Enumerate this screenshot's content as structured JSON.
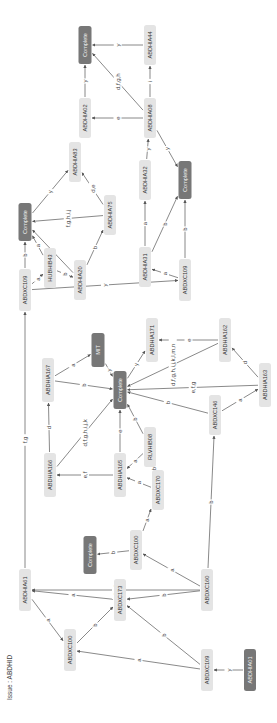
{
  "issue_label": "Issue : ABDHID",
  "colors": {
    "node_fill": "#e4e4e4",
    "complete_fill": "#777777",
    "edge": "#6b6b6b"
  },
  "nodes": [
    {
      "id": "n1",
      "label": "ABDHIA61",
      "x": 25,
      "y": 590,
      "w": 12,
      "h": 42,
      "kind": "normal"
    },
    {
      "id": "n2",
      "label": "ABDXC100",
      "x": 70,
      "y": 650,
      "w": 12,
      "h": 42,
      "kind": "normal"
    },
    {
      "id": "n3",
      "label": "ABDXC173",
      "x": 120,
      "y": 600,
      "w": 12,
      "h": 42,
      "kind": "normal"
    },
    {
      "id": "n4",
      "label": "ABDXC109",
      "x": 207,
      "y": 670,
      "w": 12,
      "h": 42,
      "kind": "normal"
    },
    {
      "id": "n5",
      "label": "ABDHIA01",
      "x": 250,
      "y": 670,
      "w": 12,
      "h": 42,
      "kind": "dark"
    },
    {
      "id": "n6",
      "label": "ABDXC160",
      "x": 207,
      "y": 590,
      "w": 12,
      "h": 42,
      "kind": "normal"
    },
    {
      "id": "n7",
      "label": "ABDXC100",
      "x": 136,
      "y": 550,
      "w": 12,
      "h": 40,
      "kind": "normal"
    },
    {
      "id": "n8",
      "label": "Complete",
      "x": 90,
      "y": 555,
      "w": 13,
      "h": 38,
      "kind": "dark"
    },
    {
      "id": "n9",
      "label": "ABDHIA166",
      "x": 50,
      "y": 475,
      "w": 12,
      "h": 44,
      "kind": "normal"
    },
    {
      "id": "n10",
      "label": "ABDHIA165",
      "x": 120,
      "y": 475,
      "w": 12,
      "h": 44,
      "kind": "normal"
    },
    {
      "id": "n11",
      "label": "ABDXC170",
      "x": 158,
      "y": 490,
      "w": 12,
      "h": 40,
      "kind": "normal"
    },
    {
      "id": "n12",
      "label": "RLVHIB08",
      "x": 150,
      "y": 447,
      "w": 12,
      "h": 40,
      "kind": "normal"
    },
    {
      "id": "n13",
      "label": "ABDHIA167",
      "x": 48,
      "y": 380,
      "w": 12,
      "h": 44,
      "kind": "normal"
    },
    {
      "id": "n14",
      "label": "MIT",
      "x": 98,
      "y": 350,
      "w": 13,
      "h": 34,
      "kind": "dark"
    },
    {
      "id": "n15",
      "label": "Complete",
      "x": 120,
      "y": 390,
      "w": 13,
      "h": 38,
      "kind": "dark"
    },
    {
      "id": "n16",
      "label": "ABDXC146",
      "x": 215,
      "y": 415,
      "w": 12,
      "h": 40,
      "kind": "normal"
    },
    {
      "id": "n17",
      "label": "ABDHIA171",
      "x": 152,
      "y": 340,
      "w": 12,
      "h": 44,
      "kind": "normal"
    },
    {
      "id": "n18",
      "label": "ABDHIA162",
      "x": 225,
      "y": 340,
      "w": 12,
      "h": 44,
      "kind": "normal"
    },
    {
      "id": "n19",
      "label": "ABDHIA163",
      "x": 265,
      "y": 385,
      "w": 12,
      "h": 44,
      "kind": "normal"
    },
    {
      "id": "n20",
      "label": "ABDXC109",
      "x": 25,
      "y": 290,
      "w": 12,
      "h": 42,
      "kind": "normal"
    },
    {
      "id": "n21",
      "label": "Complete",
      "x": 25,
      "y": 222,
      "w": 13,
      "h": 38,
      "kind": "dark"
    },
    {
      "id": "n22",
      "label": "HUBHIB43",
      "x": 50,
      "y": 268,
      "w": 12,
      "h": 40,
      "kind": "normal"
    },
    {
      "id": "n23",
      "label": "ABDHIA20",
      "x": 80,
      "y": 280,
      "w": 12,
      "h": 40,
      "kind": "normal"
    },
    {
      "id": "n24",
      "label": "ABDHIA75",
      "x": 110,
      "y": 215,
      "w": 12,
      "h": 40,
      "kind": "normal"
    },
    {
      "id": "n25",
      "label": "ABDHIA83",
      "x": 75,
      "y": 162,
      "w": 12,
      "h": 40,
      "kind": "normal"
    },
    {
      "id": "n26",
      "label": "ABDXC109",
      "x": 185,
      "y": 280,
      "w": 12,
      "h": 42,
      "kind": "normal"
    },
    {
      "id": "n27",
      "label": "ABDHIA31",
      "x": 145,
      "y": 267,
      "w": 12,
      "h": 40,
      "kind": "normal"
    },
    {
      "id": "n28",
      "label": "ABDHIA32",
      "x": 145,
      "y": 180,
      "w": 12,
      "h": 40,
      "kind": "normal"
    },
    {
      "id": "n29",
      "label": "Complete",
      "x": 185,
      "y": 180,
      "w": 13,
      "h": 38,
      "kind": "dark"
    },
    {
      "id": "n30",
      "label": "ABDHIA08",
      "x": 150,
      "y": 118,
      "w": 12,
      "h": 40,
      "kind": "normal"
    },
    {
      "id": "n31",
      "label": "ABDHIA02",
      "x": 85,
      "y": 118,
      "w": 12,
      "h": 40,
      "kind": "normal"
    },
    {
      "id": "n32",
      "label": "Complete",
      "x": 85,
      "y": 45,
      "w": 13,
      "h": 38,
      "kind": "dark"
    },
    {
      "id": "n33",
      "label": "ABDHIA44",
      "x": 150,
      "y": 45,
      "w": 12,
      "h": 40,
      "kind": "normal"
    }
  ],
  "edges": [
    {
      "from": "n1",
      "to": "n2",
      "label": "a"
    },
    {
      "from": "n3",
      "to": "n1",
      "label": "a"
    },
    {
      "from": "n6",
      "to": "n1",
      "label": "d,e,h"
    },
    {
      "from": "n2",
      "to": "n3",
      "label": "b"
    },
    {
      "from": "n4",
      "to": "n3",
      "label": "b"
    },
    {
      "from": "n4",
      "to": "n2",
      "label": "a"
    },
    {
      "from": "n5",
      "to": "n4",
      "label": "y"
    },
    {
      "from": "n6",
      "to": "n3",
      "label": "b"
    },
    {
      "from": "n6",
      "to": "n7",
      "label": "a"
    },
    {
      "from": "n7",
      "to": "n8",
      "label": "b"
    },
    {
      "from": "n7",
      "to": "n11",
      "label": "a"
    },
    {
      "from": "n11",
      "to": "n10",
      "label": "a"
    },
    {
      "from": "n12",
      "to": "n10",
      "label": "a"
    },
    {
      "from": "n11",
      "to": "n12",
      "label": "b"
    },
    {
      "from": "n9",
      "to": "n13",
      "label": "d"
    },
    {
      "from": "n9",
      "to": "n15",
      "label": "d,f,g,h,i,j,k"
    },
    {
      "from": "n10",
      "to": "n15",
      "label": "e"
    },
    {
      "from": "n10",
      "to": "n9",
      "label": "e,f"
    },
    {
      "from": "n12",
      "to": "n15",
      "label": "b"
    },
    {
      "from": "n13",
      "to": "n14",
      "label": "a"
    },
    {
      "from": "n13",
      "to": "n15",
      "label": "b"
    },
    {
      "from": "n14",
      "to": "n15",
      "label": "y"
    },
    {
      "from": "n6",
      "to": "n16",
      "label": "b"
    },
    {
      "from": "n16",
      "to": "n15",
      "label": "b"
    },
    {
      "from": "n15",
      "to": "n17",
      "label": "y"
    },
    {
      "from": "n18",
      "to": "n17",
      "label": "e"
    },
    {
      "from": "n18",
      "to": "n15",
      "label": "d,f,g,h,i,j,k,l,m,n"
    },
    {
      "from": "n19",
      "to": "n15",
      "label": "e,f,g"
    },
    {
      "from": "n19",
      "to": "n18",
      "label": "d"
    },
    {
      "from": "n16",
      "to": "n19",
      "label": "a"
    },
    {
      "from": "n1",
      "to": "n20",
      "label": "f,g"
    },
    {
      "from": "n20",
      "to": "n21",
      "label": "b"
    },
    {
      "from": "n20",
      "to": "n22",
      "label": "a"
    },
    {
      "from": "n22",
      "to": "n23",
      "label": "b"
    },
    {
      "from": "n22",
      "to": "n21",
      "label": "a"
    },
    {
      "from": "n23",
      "to": "n21",
      "label": "a"
    },
    {
      "from": "n23",
      "to": "n24",
      "label": "b"
    },
    {
      "from": "n24",
      "to": "n21",
      "label": "f,g,h,i,j"
    },
    {
      "from": "n24",
      "to": "n25",
      "label": "d,e"
    },
    {
      "from": "n21",
      "to": "n25",
      "label": "y"
    },
    {
      "from": "n20",
      "to": "n26",
      "label": "y"
    },
    {
      "from": "n26",
      "to": "n27",
      "label": "a"
    },
    {
      "from": "n27",
      "to": "n29",
      "label": "b"
    },
    {
      "from": "n26",
      "to": "n29",
      "label": "b"
    },
    {
      "from": "n27",
      "to": "n28",
      "label": "a"
    },
    {
      "from": "n28",
      "to": "n30",
      "label": "y"
    },
    {
      "from": "n30",
      "to": "n29",
      "label": "y"
    },
    {
      "from": "n30",
      "to": "n31",
      "label": "e"
    },
    {
      "from": "n30",
      "to": "n32",
      "label": "d,f,g,h"
    },
    {
      "from": "n30",
      "to": "n33",
      "label": "i"
    },
    {
      "from": "n31",
      "to": "n32",
      "label": "y"
    },
    {
      "from": "n33",
      "to": "n32",
      "label": "y"
    }
  ]
}
